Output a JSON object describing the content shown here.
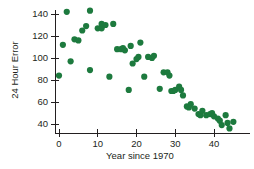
{
  "chart_data": {
    "type": "scatter",
    "title": "",
    "xlabel": "Year since 1970",
    "ylabel": "24 Hour Error",
    "xlim": [
      -2,
      47
    ],
    "ylim": [
      30,
      148
    ],
    "xticks": [
      0,
      10,
      20,
      30,
      40
    ],
    "yticks": [
      40,
      60,
      80,
      100,
      120,
      140
    ],
    "xtick_labels": [
      "0",
      "10",
      "20",
      "30",
      "40"
    ],
    "ytick_labels": [
      "40",
      "60",
      "80",
      "100",
      "120",
      "140"
    ],
    "grid": false,
    "legend": false,
    "marker_color": "#1d7a3e",
    "marker_size": 3.1,
    "axis_color": "#231f20",
    "background": "#ffffff",
    "series": [
      {
        "name": "24 Hour Error",
        "points": [
          [
            0,
            84
          ],
          [
            1,
            112
          ],
          [
            2,
            142
          ],
          [
            3,
            97
          ],
          [
            4,
            117
          ],
          [
            5,
            116
          ],
          [
            6,
            125
          ],
          [
            7,
            129
          ],
          [
            8,
            143
          ],
          [
            8,
            89
          ],
          [
            10,
            127
          ],
          [
            11,
            127
          ],
          [
            11,
            131
          ],
          [
            12,
            130
          ],
          [
            13,
            83
          ],
          [
            14,
            131
          ],
          [
            15,
            108
          ],
          [
            16,
            108
          ],
          [
            16.5,
            109
          ],
          [
            17,
            107
          ],
          [
            18,
            71
          ],
          [
            18.5,
            111
          ],
          [
            19,
            95
          ],
          [
            20,
            99
          ],
          [
            20.5,
            101
          ],
          [
            21,
            114
          ],
          [
            22,
            83
          ],
          [
            23,
            101
          ],
          [
            24,
            100
          ],
          [
            24.5,
            102
          ],
          [
            26,
            72
          ],
          [
            27,
            87
          ],
          [
            28,
            87
          ],
          [
            28.5,
            84
          ],
          [
            29,
            70
          ],
          [
            29.5,
            70
          ],
          [
            30,
            71
          ],
          [
            31,
            74
          ],
          [
            31.5,
            71
          ],
          [
            32,
            66
          ],
          [
            33,
            56
          ],
          [
            33.5,
            55
          ],
          [
            34,
            58
          ],
          [
            35,
            54
          ],
          [
            36,
            49
          ],
          [
            36.5,
            48
          ],
          [
            37,
            52
          ],
          [
            38,
            48
          ],
          [
            39,
            49
          ],
          [
            39.5,
            50
          ],
          [
            40,
            47
          ],
          [
            41,
            45
          ],
          [
            41.5,
            43
          ],
          [
            42,
            39
          ],
          [
            43,
            48
          ],
          [
            43.5,
            41
          ],
          [
            44,
            36
          ],
          [
            45,
            42
          ]
        ]
      }
    ]
  },
  "axes": {
    "y_axis_name": "24 Hour Error",
    "x_axis_name": "Year since 1970"
  }
}
